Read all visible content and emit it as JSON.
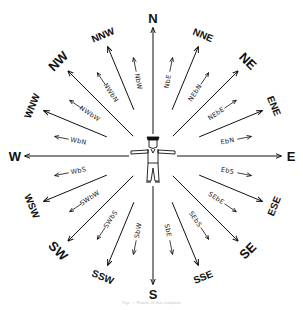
{
  "figure": {
    "center": {
      "x": 153,
      "y": 156
    },
    "colors": {
      "ink": "#111111",
      "background": "#ffffff",
      "caption": "#c8c8c8"
    },
    "caption": "Fig. — Points of the compass"
  },
  "points": [
    {
      "label": "N",
      "angle": 0,
      "class": "major"
    },
    {
      "label": "NbE",
      "angle": 11.25,
      "class": "minor"
    },
    {
      "label": "NNE",
      "angle": 22.5,
      "class": "mid"
    },
    {
      "label": "NEbN",
      "angle": 33.75,
      "class": "minor"
    },
    {
      "label": "NE",
      "angle": 45,
      "class": "major"
    },
    {
      "label": "NEbE",
      "angle": 56.25,
      "class": "minor"
    },
    {
      "label": "ENE",
      "angle": 67.5,
      "class": "mid"
    },
    {
      "label": "EbN",
      "angle": 78.75,
      "class": "minor"
    },
    {
      "label": "E",
      "angle": 90,
      "class": "major"
    },
    {
      "label": "EbS",
      "angle": 101.25,
      "class": "minor"
    },
    {
      "label": "ESE",
      "angle": 112.5,
      "class": "mid"
    },
    {
      "label": "SEbE",
      "angle": 123.75,
      "class": "minor"
    },
    {
      "label": "SE",
      "angle": 135,
      "class": "major"
    },
    {
      "label": "SEbS",
      "angle": 146.25,
      "class": "minor"
    },
    {
      "label": "SSE",
      "angle": 157.5,
      "class": "mid"
    },
    {
      "label": "SbE",
      "angle": 168.75,
      "class": "minor"
    },
    {
      "label": "S",
      "angle": 180,
      "class": "major"
    },
    {
      "label": "SbW",
      "angle": 191.25,
      "class": "minor"
    },
    {
      "label": "SSW",
      "angle": 202.5,
      "class": "mid"
    },
    {
      "label": "SWbS",
      "angle": 213.75,
      "class": "minor"
    },
    {
      "label": "SW",
      "angle": 225,
      "class": "major"
    },
    {
      "label": "SWbW",
      "angle": 236.25,
      "class": "minor"
    },
    {
      "label": "WSW",
      "angle": 247.5,
      "class": "mid"
    },
    {
      "label": "WbS",
      "angle": 258.75,
      "class": "minor"
    },
    {
      "label": "W",
      "angle": 270,
      "class": "major"
    },
    {
      "label": "WbN",
      "angle": 281.25,
      "class": "minor"
    },
    {
      "label": "WNW",
      "angle": 292.5,
      "class": "mid"
    },
    {
      "label": "NWbW",
      "angle": 303.75,
      "class": "minor"
    },
    {
      "label": "NW",
      "angle": 315,
      "class": "major"
    },
    {
      "label": "NWbN",
      "angle": 326.25,
      "class": "minor"
    },
    {
      "label": "NNW",
      "angle": 337.5,
      "class": "mid"
    },
    {
      "label": "NbW",
      "angle": 348.75,
      "class": "minor"
    }
  ]
}
